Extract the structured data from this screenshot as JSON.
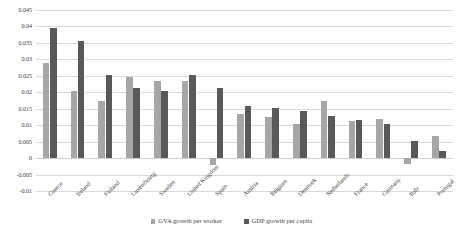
{
  "chart_data": {
    "type": "bar",
    "title": "",
    "subtitle": "",
    "xlabel": "",
    "ylabel": "",
    "ylim": [
      -0.01,
      0.045
    ],
    "yticks": [
      0.045,
      0.04,
      0.035,
      0.03,
      0.025,
      0.02,
      0.015,
      0.01,
      0.005,
      0,
      -0.005,
      -0.01
    ],
    "ytick_labels": [
      "0.045",
      "0.04",
      "0.035",
      "0.03",
      "0.025",
      "0.02",
      "0.015",
      "0.01",
      "0.005",
      "0",
      "-0.005",
      "-0.01"
    ],
    "grid": true,
    "legend_position": "bottom",
    "categories": [
      "Greece",
      "Ireland",
      "Finland",
      "Luxembourg",
      "Sweden",
      "United Kingdom",
      "Spain",
      "Austria",
      "Belgium",
      "Denmark",
      "Netherlands",
      "France",
      "Germany",
      "Italy",
      "Portugal"
    ],
    "series": [
      {
        "name": "GVA growth per worker",
        "color": "#a6a6a6",
        "values": [
          0.029,
          0.0205,
          0.0175,
          0.0245,
          0.0235,
          0.0235,
          -0.0022,
          0.0135,
          0.0125,
          0.0105,
          0.0175,
          0.0112,
          0.0118,
          -0.0018,
          0.0068
        ]
      },
      {
        "name": "GDP growth per capita",
        "color": "#595959",
        "values": [
          0.0395,
          0.0355,
          0.0252,
          0.0212,
          0.0205,
          0.0252,
          0.0212,
          0.0158,
          0.0152,
          0.0142,
          0.0128,
          0.0115,
          0.0105,
          0.0052,
          0.0022
        ]
      }
    ]
  },
  "legend": {
    "items": [
      {
        "label": "GVA growth per worker"
      },
      {
        "label": "GDP growth per capita"
      }
    ]
  },
  "colors": {
    "series_gva": "#a6a6a6",
    "series_gdp": "#595959",
    "gridline": "#d9d9d9",
    "text": "#3f3f3f",
    "background": "#ffffff"
  }
}
